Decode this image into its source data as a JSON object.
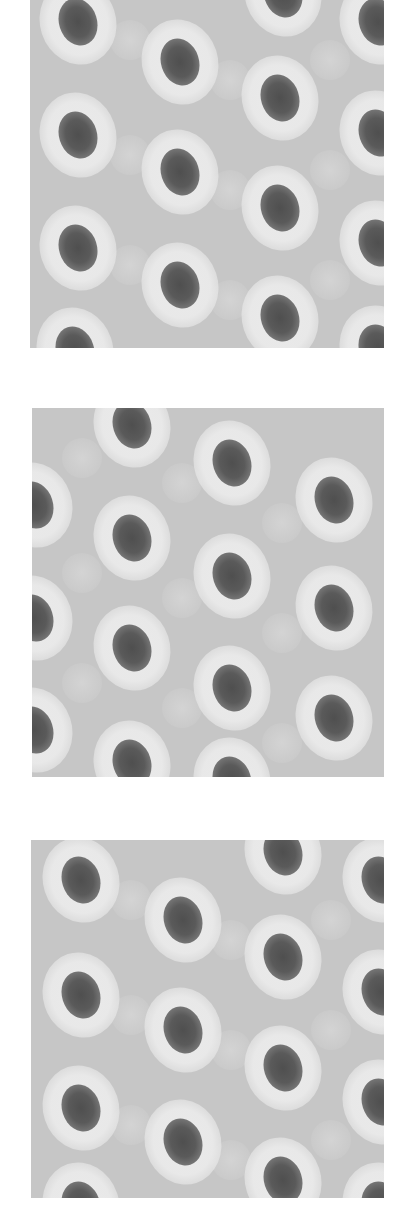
{
  "figure": {
    "colors": {
      "page_background": "#ffffff",
      "panel_background": "#c6c6c6",
      "halo": "#ececec",
      "spot_core": "#4f4f4f"
    },
    "panels": [
      {
        "id": "panel-1",
        "x": 30,
        "y": 0,
        "width": 354,
        "height": 348,
        "spots": [
          [
            48,
            22
          ],
          [
            150,
            62
          ],
          [
            250,
            98
          ],
          [
            348,
            22
          ],
          [
            48,
            135
          ],
          [
            150,
            172
          ],
          [
            250,
            208
          ],
          [
            348,
            133
          ],
          [
            48,
            248
          ],
          [
            150,
            285
          ],
          [
            250,
            318
          ],
          [
            348,
            243
          ],
          [
            253,
            -6
          ],
          [
            45,
            350
          ],
          [
            348,
            348
          ]
        ],
        "faint_spots": [
          [
            100,
            40
          ],
          [
            200,
            80
          ],
          [
            100,
            155
          ],
          [
            200,
            190
          ],
          [
            100,
            265
          ],
          [
            200,
            300
          ],
          [
            300,
            60
          ],
          [
            300,
            170
          ],
          [
            300,
            280
          ]
        ]
      },
      {
        "id": "panel-2",
        "x": 32,
        "y": 408,
        "width": 352,
        "height": 369,
        "spots": [
          [
            100,
            17
          ],
          [
            200,
            55
          ],
          [
            302,
            92
          ],
          [
            2,
            97
          ],
          [
            100,
            130
          ],
          [
            200,
            168
          ],
          [
            302,
            200
          ],
          [
            2,
            210
          ],
          [
            100,
            240
          ],
          [
            200,
            280
          ],
          [
            302,
            310
          ],
          [
            2,
            322
          ],
          [
            100,
            355
          ],
          [
            200,
            372
          ]
        ],
        "faint_spots": [
          [
            50,
            50
          ],
          [
            150,
            75
          ],
          [
            250,
            115
          ],
          [
            50,
            165
          ],
          [
            150,
            190
          ],
          [
            250,
            225
          ],
          [
            50,
            275
          ],
          [
            150,
            300
          ],
          [
            250,
            335
          ]
        ]
      },
      {
        "id": "panel-3",
        "x": 31,
        "y": 840,
        "width": 353,
        "height": 358,
        "spots": [
          [
            50,
            40
          ],
          [
            152,
            80
          ],
          [
            252,
            117
          ],
          [
            252,
            12
          ],
          [
            350,
            40
          ],
          [
            50,
            155
          ],
          [
            152,
            190
          ],
          [
            252,
            228
          ],
          [
            350,
            152
          ],
          [
            50,
            268
          ],
          [
            152,
            302
          ],
          [
            252,
            340
          ],
          [
            350,
            262
          ],
          [
            50,
            365
          ],
          [
            350,
            365
          ]
        ],
        "faint_spots": [
          [
            100,
            60
          ],
          [
            200,
            100
          ],
          [
            300,
            80
          ],
          [
            100,
            175
          ],
          [
            200,
            210
          ],
          [
            300,
            190
          ],
          [
            100,
            285
          ],
          [
            200,
            320
          ],
          [
            300,
            300
          ]
        ]
      }
    ],
    "spot_size": {
      "core_w": 38,
      "core_h": 48,
      "halo_w": 76,
      "halo_h": 86
    }
  }
}
